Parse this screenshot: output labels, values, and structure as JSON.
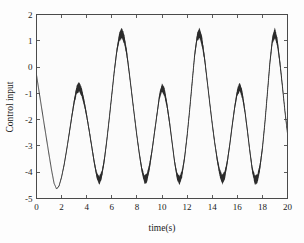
{
  "chart_data": {
    "type": "line",
    "title": "",
    "xlabel": "time(s)",
    "ylabel": "Control input",
    "xlim": [
      0,
      20
    ],
    "ylim": [
      -5,
      2
    ],
    "xticks": [
      0,
      2,
      4,
      6,
      8,
      10,
      12,
      14,
      16,
      18,
      20
    ],
    "xtick_labels": [
      "0",
      "2",
      "4",
      "6",
      "8",
      "10",
      "12",
      "14",
      "16",
      "18",
      "20"
    ],
    "yticks": [
      -5,
      -4,
      -3,
      -2,
      -1,
      0,
      1,
      2
    ],
    "ytick_labels": [
      "-5",
      "-4",
      "-3",
      "-2",
      "-1",
      "0",
      "1",
      "2"
    ],
    "grid": false,
    "legend": null,
    "series": [
      {
        "name": "control input u(t)",
        "color": "#2b2b2b",
        "description": "sliding-mode control signal with high-frequency chattering band after initial transient",
        "x": [
          0.0,
          0.2,
          0.4,
          0.6,
          0.8,
          1.0,
          1.2,
          1.4,
          1.6,
          1.8,
          2.0,
          2.2,
          2.4,
          2.6,
          2.8,
          3.0,
          3.2,
          3.4,
          3.6,
          3.8,
          4.0,
          4.2,
          4.4,
          4.6,
          4.8,
          5.0,
          5.2,
          5.4,
          5.6,
          5.8,
          6.0,
          6.2,
          6.4,
          6.6,
          6.8,
          7.0,
          7.2,
          7.4,
          7.6,
          7.8,
          8.0,
          8.2,
          8.4,
          8.6,
          8.8,
          9.0,
          9.2,
          9.4,
          9.6,
          9.8,
          10.0,
          10.2,
          10.4,
          10.6,
          10.8,
          11.0,
          11.2,
          11.4,
          11.6,
          11.8,
          12.0,
          12.2,
          12.4,
          12.6,
          12.8,
          13.0,
          13.2,
          13.4,
          13.6,
          13.8,
          14.0,
          14.2,
          14.4,
          14.6,
          14.8,
          15.0,
          15.2,
          15.4,
          15.6,
          15.8,
          16.0,
          16.2,
          16.4,
          16.6,
          16.8,
          17.0,
          17.2,
          17.4,
          17.6,
          17.8,
          18.0,
          18.2,
          18.4,
          18.6,
          18.8,
          19.0,
          19.2,
          19.4,
          19.6,
          19.8,
          20.0
        ],
        "y": [
          -0.3,
          -0.92,
          -1.53,
          -2.14,
          -2.74,
          -3.34,
          -3.92,
          -4.42,
          -4.64,
          -4.52,
          -4.18,
          -3.72,
          -3.16,
          -2.55,
          -1.92,
          -1.32,
          -0.86,
          -0.75,
          -0.95,
          -1.35,
          -1.85,
          -2.42,
          -3.02,
          -3.62,
          -4.12,
          -4.32,
          -4.1,
          -3.55,
          -2.8,
          -1.95,
          -1.05,
          -0.15,
          0.62,
          1.15,
          1.3,
          1.05,
          0.5,
          -0.25,
          -1.05,
          -1.85,
          -2.62,
          -3.32,
          -3.92,
          -4.28,
          -4.22,
          -3.8,
          -3.2,
          -2.5,
          -1.8,
          -1.1,
          -0.78,
          -0.95,
          -1.45,
          -2.1,
          -2.85,
          -3.6,
          -4.15,
          -4.32,
          -4.05,
          -3.45,
          -2.62,
          -1.65,
          -0.6,
          0.45,
          1.15,
          1.3,
          0.95,
          0.3,
          -0.52,
          -1.35,
          -2.15,
          -2.88,
          -3.52,
          -4.02,
          -4.28,
          -4.12,
          -3.62,
          -2.95,
          -2.2,
          -1.5,
          -0.95,
          -0.75,
          -1.05,
          -1.65,
          -2.4,
          -3.2,
          -3.92,
          -4.3,
          -4.25,
          -3.82,
          -3.1,
          -2.12,
          -0.98,
          0.18,
          1.05,
          1.3,
          0.92,
          0.15,
          -0.75,
          -1.7,
          -2.52
        ],
        "chatter_half_width": [
          0.0,
          0.0,
          0.0,
          0.0,
          0.0,
          0.0,
          0.0,
          0.0,
          0.0,
          0.02,
          0.04,
          0.06,
          0.07,
          0.08,
          0.1,
          0.13,
          0.16,
          0.18,
          0.17,
          0.14,
          0.11,
          0.1,
          0.1,
          0.11,
          0.13,
          0.16,
          0.15,
          0.12,
          0.1,
          0.09,
          0.09,
          0.1,
          0.13,
          0.17,
          0.2,
          0.19,
          0.15,
          0.11,
          0.09,
          0.09,
          0.09,
          0.1,
          0.12,
          0.16,
          0.18,
          0.16,
          0.12,
          0.1,
          0.1,
          0.13,
          0.16,
          0.17,
          0.14,
          0.11,
          0.09,
          0.1,
          0.14,
          0.17,
          0.15,
          0.11,
          0.09,
          0.09,
          0.09,
          0.11,
          0.16,
          0.2,
          0.19,
          0.14,
          0.1,
          0.09,
          0.09,
          0.1,
          0.12,
          0.15,
          0.18,
          0.17,
          0.13,
          0.1,
          0.1,
          0.12,
          0.15,
          0.17,
          0.16,
          0.12,
          0.1,
          0.1,
          0.13,
          0.17,
          0.18,
          0.15,
          0.11,
          0.09,
          0.09,
          0.11,
          0.16,
          0.19,
          0.18,
          0.13,
          0.09,
          0.07,
          0.05
        ],
        "peaks_large": [
          {
            "t": 6.3,
            "y": 1.3
          },
          {
            "t": 12.6,
            "y": 1.3
          },
          {
            "t": 18.9,
            "y": 1.3
          }
        ],
        "peaks_small": [
          {
            "t": 3.2,
            "y": -0.75
          },
          {
            "t": 9.5,
            "y": -0.78
          },
          {
            "t": 15.7,
            "y": -0.75
          }
        ],
        "troughs": [
          {
            "t": 1.5,
            "y": -4.65
          },
          {
            "t": 4.7,
            "y": -4.33
          },
          {
            "t": 8.0,
            "y": -4.3
          },
          {
            "t": 10.9,
            "y": -4.33
          },
          {
            "t": 14.2,
            "y": -4.3
          },
          {
            "t": 17.2,
            "y": -4.32
          }
        ],
        "start_point": {
          "t": 0.0,
          "y": -0.3
        },
        "end_point": {
          "t": 20.0,
          "y": -2.52
        }
      }
    ]
  },
  "figure": {
    "background_color": "#fdfdfd",
    "plot_background_color": "#fbfbfb",
    "axis_color": "#4a4a4a",
    "trace_color": "#2b2b2b"
  }
}
